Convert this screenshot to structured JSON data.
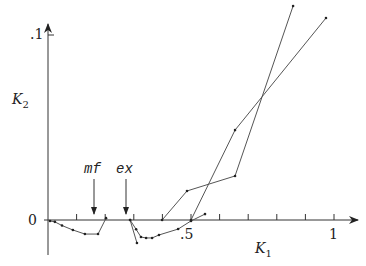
{
  "chart_data": {
    "type": "line",
    "title": "",
    "xlabel": "K1",
    "ylabel": "K2",
    "xlim": [
      0,
      1.05
    ],
    "ylim": [
      -0.013,
      0.105
    ],
    "x_ticks": [
      0.1,
      0.2,
      0.3,
      0.4,
      0.5,
      0.6,
      0.7,
      0.8,
      0.9,
      1.0
    ],
    "x_tick_labels": [
      ".5",
      "1"
    ],
    "y_tick_labels": [
      "0",
      ".1"
    ],
    "grid": false,
    "annotations": [
      {
        "text": "mf",
        "x": 0.16,
        "arrow_to_y": 0.0
      },
      {
        "text": "ex",
        "x": 0.27,
        "arrow_to_y": 0.0
      }
    ],
    "series": [
      {
        "name": "curve-1",
        "points": [
          [
            0.007,
            -0.0005
          ],
          [
            0.024,
            -0.001
          ],
          [
            0.049,
            -0.003
          ],
          [
            0.087,
            -0.0054
          ],
          [
            0.129,
            -0.0076
          ],
          [
            0.175,
            -0.0076
          ],
          [
            0.203,
            0.001
          ]
        ]
      },
      {
        "name": "curve-2",
        "points": [
          [
            0.287,
            0.0
          ],
          [
            0.311,
            -0.0124
          ]
        ]
      },
      {
        "name": "curve-3",
        "points": [
          [
            0.287,
            0.0
          ],
          [
            0.308,
            -0.005
          ],
          [
            0.325,
            -0.0092
          ],
          [
            0.343,
            -0.0097
          ],
          [
            0.364,
            -0.0097
          ],
          [
            0.388,
            -0.0081
          ],
          [
            0.455,
            -0.0049
          ],
          [
            0.5,
            -0.0005
          ],
          [
            0.549,
            0.0032
          ]
        ]
      },
      {
        "name": "curve-4",
        "points": [
          [
            0.399,
            0.0
          ],
          [
            0.486,
            0.0157
          ],
          [
            0.654,
            0.0238
          ],
          [
            0.857,
            0.1157
          ]
        ]
      },
      {
        "name": "curve-5",
        "points": [
          [
            0.5,
            0.0
          ],
          [
            0.654,
            0.0486
          ],
          [
            0.972,
            0.1092
          ]
        ]
      }
    ]
  },
  "labels": {
    "y_top": ".1",
    "y_zero": "0",
    "x_half": ".5",
    "x_one": "1",
    "xlabel_main": "K",
    "xlabel_sub": "1",
    "ylabel_main": "K",
    "ylabel_sub": "2",
    "mf": "mf",
    "ex": "ex"
  }
}
